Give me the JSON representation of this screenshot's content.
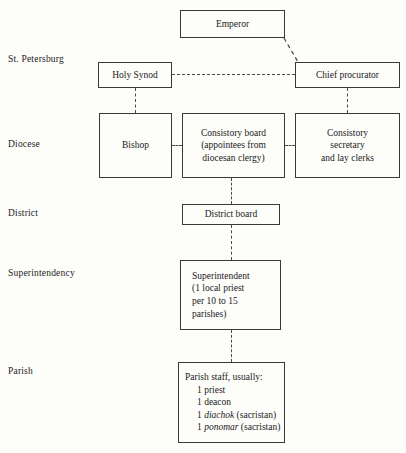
{
  "figure": {
    "type": "org-hierarchy-diagram",
    "background_color": "#fdfdfa",
    "line_color": "#4a4a48",
    "border_color": "#3a3a38"
  },
  "row_labels": [
    {
      "id": "st-petersburg",
      "text": "St. Petersburg"
    },
    {
      "id": "diocese",
      "text": "Diocese"
    },
    {
      "id": "district",
      "text": "District"
    },
    {
      "id": "superintendency",
      "text": "Superintendency"
    },
    {
      "id": "parish",
      "text": "Parish"
    }
  ],
  "nodes": {
    "emperor": {
      "label": "Emperor"
    },
    "holy_synod": {
      "label": "Holy  Synod"
    },
    "chief_procurator": {
      "label": "Chief procurator"
    },
    "bishop": {
      "label": "Bishop"
    },
    "consistory_board": {
      "lines": [
        "Consistory board",
        "(appointees from",
        "diocesan clergy)"
      ]
    },
    "consistory_secretary": {
      "lines": [
        "Consistory",
        "secretary",
        "and lay clerks"
      ]
    },
    "district_board": {
      "label": "District board"
    },
    "superintendent": {
      "lines": [
        "Superintendent",
        "(1 local priest",
        "per 10 to 15",
        "parishes)"
      ]
    },
    "parish_staff": {
      "heading": "Parish staff, usually:",
      "items": [
        {
          "count": "1 ",
          "term": "priest",
          "italic": "",
          "suffix": ""
        },
        {
          "count": "1 ",
          "term": "deacon",
          "italic": "",
          "suffix": ""
        },
        {
          "count": "1 ",
          "term": "",
          "italic": "diachok",
          "suffix": " (sacristan)"
        },
        {
          "count": "1 ",
          "term": "",
          "italic": "ponomar",
          "suffix": " (sacristan)"
        }
      ]
    }
  },
  "connections": [
    {
      "from": "emperor",
      "to": "chief_procurator",
      "style": "dashed-diagonal"
    },
    {
      "from": "holy_synod",
      "to": "chief_procurator",
      "style": "dashed-horizontal"
    },
    {
      "from": "holy_synod",
      "to": "bishop",
      "style": "dashed-vertical"
    },
    {
      "from": "chief_procurator",
      "to": "consistory_secretary",
      "style": "dashed-vertical"
    },
    {
      "from": "bishop",
      "to": "consistory_board",
      "style": "dashed-horizontal-short"
    },
    {
      "from": "consistory_board",
      "to": "consistory_secretary",
      "style": "dashed-horizontal-short"
    },
    {
      "from": "consistory_board",
      "to": "district_board",
      "style": "dashed-vertical"
    },
    {
      "from": "district_board",
      "to": "superintendent",
      "style": "dashed-vertical"
    },
    {
      "from": "superintendent",
      "to": "parish_staff",
      "style": "dashed-vertical"
    }
  ]
}
